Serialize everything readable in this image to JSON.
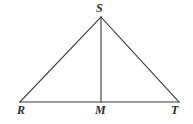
{
  "figure": {
    "kind": "geometry-diagram",
    "shape": "triangle-with-median",
    "background_color": "#ffffff",
    "stroke_color": "#3a3a3a",
    "label_color": "#2f2f2f",
    "labels": {
      "apex": "S",
      "base_left": "R",
      "base_mid": "M",
      "base_right": "T"
    },
    "points": {
      "S": {
        "x": 101,
        "y": 17
      },
      "R": {
        "x": 20,
        "y": 102
      },
      "M": {
        "x": 101,
        "y": 102
      },
      "T": {
        "x": 179,
        "y": 102
      }
    },
    "segments": [
      {
        "name": "RS",
        "from": "R",
        "to": "S"
      },
      {
        "name": "ST",
        "from": "S",
        "to": "T"
      },
      {
        "name": "RT",
        "from": "R",
        "to": "T"
      },
      {
        "name": "SM",
        "from": "S",
        "to": "M"
      }
    ]
  }
}
